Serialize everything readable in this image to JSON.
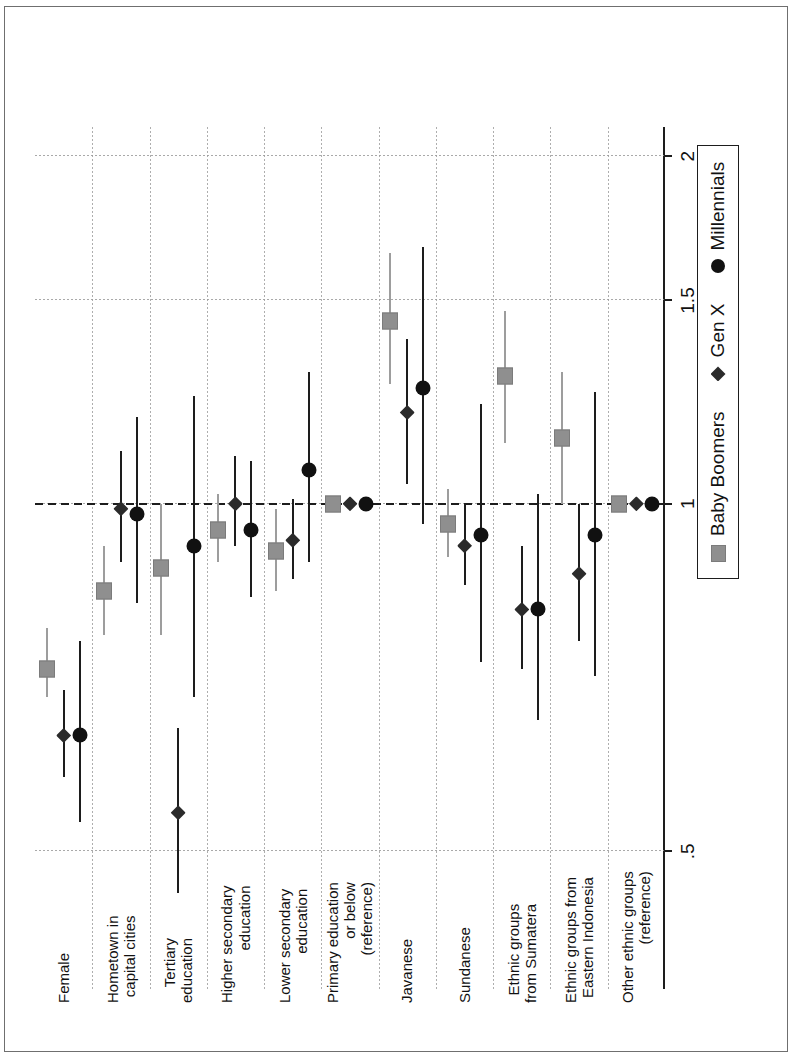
{
  "figure": {
    "orientation": "rotated-90-landscape-scan",
    "background": "#ffffff"
  },
  "legend": {
    "position": "below-axis-right",
    "items": [
      {
        "label": "Baby Boomers",
        "marker": "square-marker",
        "color": "#8f8f8f"
      },
      {
        "label": "Gen X",
        "marker": "diamond-marker",
        "color": "#2b2b2b"
      },
      {
        "label": "Millennials",
        "marker": "circle-marker",
        "color": "#111111"
      }
    ]
  },
  "axis": {
    "scale": "log",
    "reference_value": 1,
    "ticks": [
      ".5",
      "1",
      "1.5",
      "2"
    ],
    "tick_values": [
      0.5,
      1,
      1.5,
      2
    ]
  },
  "chart_data": {
    "type": "scatter",
    "subtype": "coefficient-plot-odds-ratio-with-confidence-intervals",
    "title": "",
    "xlabel": "",
    "ylabel": "",
    "xlim": [
      0.38,
      2.12
    ],
    "grid": true,
    "legend_position": "bottom-right",
    "categories": [
      "Female",
      "Hometown in\ncapital cities",
      "Tertiary\neducation",
      "Higher secondary\neducation",
      "Lower secondary\neducation",
      "Primary education\nor below\n(reference)",
      "Javanese",
      "Sundanese",
      "Ethnic groups\nfrom Sumatera",
      "Ethnic groups from\nEastern Indonesia",
      "Other ethnic groups\n(reference)"
    ],
    "series": [
      {
        "name": "Baby Boomers",
        "marker": "square",
        "color": "#8f8f8f",
        "values": [
          0.72,
          0.84,
          0.88,
          0.95,
          0.91,
          1.0,
          1.44,
          0.96,
          1.29,
          1.14,
          1.0
        ],
        "ci_low": [
          0.68,
          0.77,
          0.77,
          0.89,
          0.84,
          null,
          1.27,
          0.9,
          1.13,
          1.0,
          null
        ],
        "ci_high": [
          0.78,
          0.92,
          1.0,
          1.02,
          0.99,
          null,
          1.65,
          1.03,
          1.47,
          1.3,
          null
        ]
      },
      {
        "name": "Gen X",
        "marker": "diamond",
        "color": "#2b2b2b",
        "values": [
          0.63,
          0.99,
          0.54,
          1.0,
          0.93,
          1.0,
          1.2,
          0.92,
          0.81,
          0.87,
          1.0
        ],
        "ci_low": [
          0.58,
          0.89,
          0.46,
          0.92,
          0.86,
          null,
          1.04,
          0.85,
          0.72,
          0.76,
          null
        ],
        "ci_high": [
          0.69,
          1.11,
          0.64,
          1.1,
          1.01,
          null,
          1.39,
          1.0,
          0.92,
          1.0,
          null
        ]
      },
      {
        "name": "Millennials",
        "marker": "circle",
        "color": "#111111",
        "values": [
          0.63,
          0.98,
          0.92,
          0.95,
          1.07,
          1.0,
          1.26,
          0.94,
          0.81,
          0.94,
          1.0
        ],
        "ci_low": [
          0.53,
          0.82,
          0.68,
          0.83,
          0.89,
          null,
          0.96,
          0.73,
          0.65,
          0.71,
          null
        ],
        "ci_high": [
          0.76,
          1.19,
          1.24,
          1.09,
          1.3,
          null,
          1.67,
          1.22,
          1.02,
          1.25,
          null
        ]
      }
    ]
  }
}
